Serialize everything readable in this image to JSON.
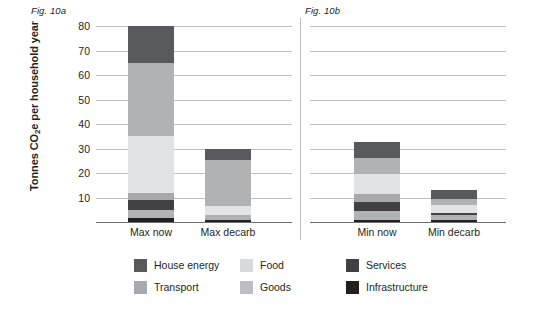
{
  "figures": {
    "a_caption": "Fig. 10a",
    "b_caption": "Fig. 10b"
  },
  "axis": {
    "y_title_main": "Tonnes CO",
    "y_title_sub": "2",
    "y_title_rest": "e per household year",
    "y_ticks": [
      "80",
      "70",
      "60",
      "50",
      "40",
      "30",
      "20",
      "10"
    ]
  },
  "legend": {
    "items": [
      {
        "label": "House energy",
        "color": "#58595b"
      },
      {
        "label": "Food",
        "color": "#d9dadb"
      },
      {
        "label": "Services",
        "color": "#414042"
      },
      {
        "label": "Transport",
        "color": "#a7a9ac"
      },
      {
        "label": "Goods",
        "color": "#bcbec0"
      },
      {
        "label": "Infrastructure",
        "color": "#231f20"
      }
    ]
  },
  "colors": {
    "house_energy": "#58595b",
    "food": "#d9dadb",
    "services": "#414042",
    "transport": "#a7a9ac",
    "goods": "#bcbec0",
    "infrastructure": "#231f20",
    "gridline": "#bcbec0",
    "axis": "#6d6e71",
    "text": "#231f20"
  },
  "chart_data": {
    "type": "bar",
    "subtype": "stacked",
    "title": "",
    "xlabel": "",
    "ylabel": "Tonnes CO2e per household year",
    "ylim": [
      0,
      80
    ],
    "yticks": [
      10,
      20,
      30,
      40,
      50,
      60,
      70,
      80
    ],
    "grid": true,
    "legend_position": "bottom",
    "panels": [
      {
        "caption": "Fig. 10a",
        "categories": [
          "Max now",
          "Max decarb"
        ],
        "totals": [
          80,
          30
        ],
        "series": [
          {
            "name": "Infrastructure",
            "color": "#231f20",
            "values": [
              1.5,
              1.0
            ]
          },
          {
            "name": "Goods",
            "color": "#bcbec0",
            "values": [
              3.5,
              2.0
            ]
          },
          {
            "name": "Services",
            "color": "#414042",
            "values": [
              4.0,
              0.5
            ]
          },
          {
            "name": "Transport",
            "color": "#a7a9ac",
            "values": [
              3.0,
              1.0
            ]
          },
          {
            "name": "Food",
            "color": "#d9dadb",
            "values": [
              23.0,
              3.5
            ]
          },
          {
            "name": "House energy",
            "color": "#58595b",
            "values": [
              30.0,
              18.0
            ]
          },
          {
            "name": "Services (top)",
            "color": "#58595b",
            "values": [
              15.0,
              4.0
            ]
          }
        ]
      },
      {
        "caption": "Fig. 10b",
        "categories": [
          "Min now",
          "Min decarb"
        ],
        "totals": [
          32.5,
          13.0
        ],
        "series": [
          {
            "name": "Infrastructure",
            "color": "#231f20",
            "values": [
              1.0,
              0.8
            ]
          },
          {
            "name": "Goods",
            "color": "#bcbec0",
            "values": [
              3.5,
              2.2
            ]
          },
          {
            "name": "Services",
            "color": "#414042",
            "values": [
              3.5,
              1.0
            ]
          },
          {
            "name": "Transport",
            "color": "#a7a9ac",
            "values": [
              3.0,
              1.5
            ]
          },
          {
            "name": "Food",
            "color": "#d9dadb",
            "values": [
              8.0,
              3.5
            ]
          },
          {
            "name": "House energy",
            "color": "#58595b",
            "values": [
              7.0,
              2.0
            ]
          },
          {
            "name": "Services (top)",
            "color": "#58595b",
            "values": [
              6.5,
              2.0
            ]
          }
        ]
      }
    ]
  },
  "bars": {
    "max_now": {
      "label": "Max now",
      "total": 80,
      "segments": [
        {
          "name": "infrastructure",
          "value": 1.5,
          "color": "#231f20"
        },
        {
          "name": "goods",
          "value": 3.5,
          "color": "#b0b2b4"
        },
        {
          "name": "services",
          "value": 4.0,
          "color": "#414042"
        },
        {
          "name": "transport",
          "value": 3.0,
          "color": "#a7a9ac"
        },
        {
          "name": "food",
          "value": 23.0,
          "color": "#e2e3e4"
        },
        {
          "name": "goods-upper",
          "value": 30.0,
          "color": "#b0b2b4"
        },
        {
          "name": "house-energy",
          "value": 15.0,
          "color": "#58595b"
        }
      ]
    },
    "max_decarb": {
      "label": "Max decarb",
      "total": 30,
      "segments": [
        {
          "name": "infrastructure",
          "value": 1.0,
          "color": "#231f20"
        },
        {
          "name": "goods",
          "value": 2.0,
          "color": "#b0b2b4"
        },
        {
          "name": "food",
          "value": 3.5,
          "color": "#e2e3e4"
        },
        {
          "name": "goods-upper",
          "value": 19.0,
          "color": "#b0b2b4"
        },
        {
          "name": "house-energy",
          "value": 4.5,
          "color": "#58595b"
        }
      ]
    },
    "min_now": {
      "label": "Min now",
      "total": 32.5,
      "segments": [
        {
          "name": "infrastructure",
          "value": 1.0,
          "color": "#231f20"
        },
        {
          "name": "goods",
          "value": 3.5,
          "color": "#b0b2b4"
        },
        {
          "name": "services",
          "value": 3.5,
          "color": "#414042"
        },
        {
          "name": "transport",
          "value": 3.5,
          "color": "#a7a9ac"
        },
        {
          "name": "food",
          "value": 8.0,
          "color": "#e2e3e4"
        },
        {
          "name": "goods-upper",
          "value": 6.5,
          "color": "#b0b2b4"
        },
        {
          "name": "house-energy",
          "value": 6.5,
          "color": "#58595b"
        }
      ]
    },
    "min_decarb": {
      "label": "Min decarb",
      "total": 13.0,
      "segments": [
        {
          "name": "infrastructure",
          "value": 0.8,
          "color": "#231f20"
        },
        {
          "name": "goods",
          "value": 2.0,
          "color": "#b0b2b4"
        },
        {
          "name": "services",
          "value": 1.0,
          "color": "#414042"
        },
        {
          "name": "food",
          "value": 3.2,
          "color": "#e2e3e4"
        },
        {
          "name": "goods-upper",
          "value": 2.5,
          "color": "#b0b2b4"
        },
        {
          "name": "house-energy",
          "value": 3.5,
          "color": "#58595b"
        }
      ]
    }
  }
}
